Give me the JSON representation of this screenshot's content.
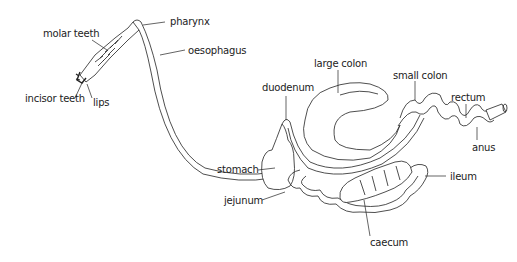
{
  "diagram": {
    "labels": {
      "molar_teeth": "molar teeth",
      "incisor_teeth": "incisor teeth",
      "lips": "lips",
      "pharynx": "pharynx",
      "oesophagus": "oesophagus",
      "duodenum": "duodenum",
      "large_colon": "large colon",
      "small_colon": "small colon",
      "rectum": "rectum",
      "anus": "anus",
      "stomach": "stomach",
      "jejunum": "jejunum",
      "ileum": "ileum",
      "caecum": "caecum"
    },
    "colors": {
      "ink": "#222222",
      "background": "#ffffff"
    }
  }
}
